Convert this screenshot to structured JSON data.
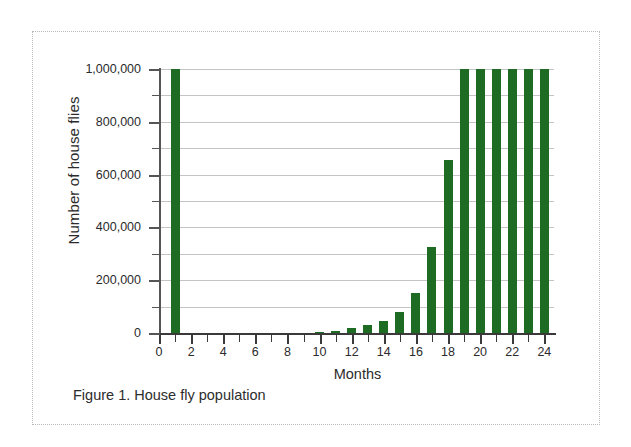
{
  "figure": {
    "caption": "Figure 1. House fly population",
    "frame_style": "dotted",
    "background": "#ffffff"
  },
  "chart_data": {
    "type": "bar",
    "title": "",
    "subtitle": "",
    "xlabel": "Months",
    "ylabel": "Number of house flies",
    "bar_color": "#1e6b23",
    "grid": true,
    "grid_axis": "y",
    "gridline_interval": 100000,
    "legend": null,
    "legend_position": "none",
    "xlim": [
      0,
      24.6
    ],
    "ylim": [
      0,
      1000000
    ],
    "y_tick_interval_major": 200000,
    "y_tick_interval_minor": 100000,
    "x_tick_interval_major": 2,
    "x_tick_interval_minor": 1,
    "x_tick_labels": [
      "0",
      "2",
      "4",
      "6",
      "8",
      "10",
      "12",
      "14",
      "16",
      "18",
      "20",
      "22",
      "24"
    ],
    "x_tick_values": [
      0,
      2,
      4,
      6,
      8,
      10,
      12,
      14,
      16,
      18,
      20,
      22,
      24
    ],
    "y_tick_labels": [
      "0",
      "200,000",
      "400,000",
      "600,000",
      "800,000",
      "1,000,000"
    ],
    "y_tick_values": [
      0,
      200000,
      400000,
      600000,
      800000,
      1000000
    ],
    "note": "Bars at months 19-24 are clipped at the top of the axis (values at or above 1,000,000).",
    "categories": [
      1,
      2,
      3,
      4,
      5,
      6,
      7,
      8,
      9,
      10,
      11,
      12,
      13,
      14,
      15,
      16,
      17,
      18,
      19,
      20,
      21,
      22,
      23,
      24
    ],
    "values": [
      1000000,
      0,
      0,
      0,
      0,
      0,
      0,
      0,
      0,
      4000,
      9000,
      18000,
      30000,
      45000,
      78000,
      150000,
      325000,
      655000,
      1000000,
      1000000,
      1000000,
      1000000,
      1000000,
      1000000
    ]
  }
}
